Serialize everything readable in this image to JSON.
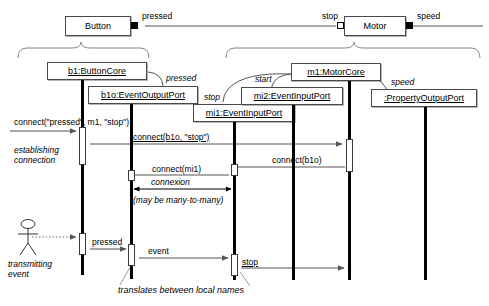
{
  "diagram": {
    "type": "uml-sequence-diagram"
  },
  "structure": {
    "components": [
      {
        "name": "Button",
        "port_label": "pressed",
        "port_kind": "filled"
      },
      {
        "name": "Motor",
        "port_left_label": "stop",
        "port_left_kind": "open",
        "port_right_label": "speed",
        "port_right_kind": "filled"
      }
    ],
    "connector_label_stop": "stop",
    "connector_label_speed": "speed",
    "connector_label_pressed": "pressed"
  },
  "lifelines": [
    {
      "id": "b1",
      "label": "b1:ButtonCore",
      "role_label": "pressed"
    },
    {
      "id": "b1o",
      "label": "b1o:EventOutputPort"
    },
    {
      "id": "mi1",
      "label": "mi1:EventInputPort",
      "role_label": "stop"
    },
    {
      "id": "mi2",
      "label": "mi2:EventInputPort",
      "role_label": "start"
    },
    {
      "id": "m1",
      "label": "m1:MotorCore"
    },
    {
      "id": "pop",
      "label": ":PropertyOutputPort",
      "role_label": "speed"
    }
  ],
  "messages": [
    {
      "id": "m-connect-pressed",
      "text": "connect(\"pressed\", m1, \"stop\")"
    },
    {
      "id": "m-connect-b1o-stop",
      "text": "connect(b1o, \"stop\")"
    },
    {
      "id": "m-connect-b1o",
      "text": "connect(b1o)"
    },
    {
      "id": "m-connect-mi1",
      "text": "connect(mi1)"
    },
    {
      "id": "m-connexion",
      "text": "connexion"
    },
    {
      "id": "m-many",
      "text": "(may be many-to-many)"
    },
    {
      "id": "m-pressed",
      "text": "pressed"
    },
    {
      "id": "m-event",
      "text": "event"
    },
    {
      "id": "m-stop",
      "text": "stop"
    }
  ],
  "annotations": {
    "phase_connect_line1": "establishing",
    "phase_connect_line2": "connection",
    "phase_transmit_line1": "transmitting",
    "phase_transmit_line2": "event",
    "translate_note": "translates between local names"
  },
  "colors": {
    "stroke": "#4a4a4a",
    "lifeline": "#000000",
    "arrow": "#555555",
    "background": "#ffffff"
  }
}
